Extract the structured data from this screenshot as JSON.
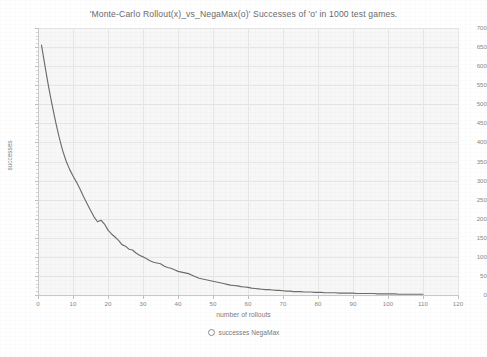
{
  "chart_data": {
    "type": "line",
    "title": "'Monte-Carlo Rollout(x)_vs_NegaMax(o)'  Successes of 'o' in 1000 test games.",
    "xlabel": "number of rollouts",
    "ylabel": "successes",
    "xlim": [
      0,
      120
    ],
    "ylim": [
      0,
      700
    ],
    "xticks": [
      0,
      10,
      20,
      30,
      40,
      50,
      60,
      70,
      80,
      90,
      100,
      110,
      120
    ],
    "yticks": [
      0,
      50,
      100,
      150,
      200,
      250,
      300,
      350,
      400,
      450,
      500,
      550,
      600,
      650,
      700
    ],
    "grid": true,
    "legend_position": "below-axes",
    "series": [
      {
        "name": "successes NegaMax",
        "marker": "circle-open",
        "color": "#6d6d6d",
        "x": [
          1,
          2,
          3,
          4,
          5,
          6,
          7,
          8,
          9,
          10,
          11,
          12,
          13,
          14,
          15,
          16,
          17,
          18,
          19,
          20,
          21,
          22,
          23,
          24,
          25,
          26,
          27,
          28,
          29,
          30,
          31,
          32,
          33,
          34,
          35,
          36,
          37,
          38,
          39,
          40,
          41,
          42,
          43,
          44,
          45,
          46,
          47,
          48,
          49,
          50,
          51,
          52,
          53,
          54,
          55,
          56,
          57,
          58,
          59,
          60,
          61,
          62,
          63,
          64,
          65,
          66,
          67,
          68,
          69,
          70,
          71,
          72,
          73,
          74,
          75,
          76,
          77,
          78,
          79,
          80,
          81,
          82,
          83,
          84,
          85,
          86,
          87,
          88,
          89,
          90,
          91,
          92,
          93,
          94,
          95,
          96,
          97,
          98,
          99,
          100,
          101,
          102,
          103,
          104,
          105,
          106,
          107,
          108,
          109,
          110
        ],
        "y": [
          655,
          600,
          547,
          500,
          455,
          415,
          380,
          352,
          330,
          312,
          296,
          278,
          258,
          240,
          222,
          205,
          192,
          196,
          186,
          170,
          160,
          152,
          143,
          132,
          128,
          120,
          118,
          110,
          104,
          100,
          95,
          90,
          86,
          84,
          82,
          76,
          72,
          70,
          66,
          62,
          60,
          58,
          56,
          52,
          48,
          44,
          42,
          40,
          38,
          36,
          34,
          32,
          30,
          28,
          26,
          25,
          24,
          22,
          21,
          20,
          18,
          17,
          16,
          15,
          14,
          14,
          13,
          12,
          12,
          11,
          10,
          10,
          9,
          9,
          9,
          8,
          8,
          8,
          7,
          7,
          7,
          6,
          6,
          6,
          6,
          5,
          5,
          5,
          5,
          5,
          4,
          4,
          4,
          4,
          4,
          4,
          3,
          3,
          3,
          3,
          3,
          3,
          2,
          2,
          2,
          2,
          2,
          2,
          2,
          2
        ]
      }
    ]
  },
  "legend": {
    "entry_label": "successes NegaMax",
    "marker_name": "circle-open-marker"
  },
  "colors": {
    "line": "#6d6d6d",
    "plot_background": "#f7f7f7",
    "grid": "#e6e6e6",
    "axis": "#c8c8c8",
    "text": "#7d7d7d"
  }
}
